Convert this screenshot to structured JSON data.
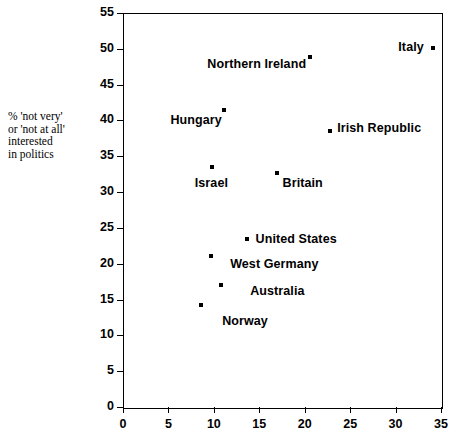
{
  "axis_caption": "% 'not very'\nor 'not at all'\ninterested\nin politics",
  "chart_data": {
    "type": "scatter",
    "title": "",
    "xlabel": "",
    "ylabel": "% 'not very' or 'not at all' interested in politics",
    "xlim": [
      0,
      35
    ],
    "ylim": [
      0,
      55
    ],
    "xticks": [
      "0",
      "5",
      "10",
      "15",
      "20",
      "25",
      "30",
      "35"
    ],
    "yticks": [
      "0",
      "5",
      "10",
      "15",
      "20",
      "25",
      "30",
      "35",
      "40",
      "45",
      "50",
      "55"
    ],
    "grid": false,
    "legend": "none",
    "marker_color": "#000000",
    "points": [
      {
        "label": "Italy",
        "x": 34.1,
        "y": 50.1,
        "label_side": "left",
        "label_dx": -9,
        "label_dy": -1
      },
      {
        "label": "Northern Ireland",
        "x": 20.6,
        "y": 48.9,
        "label_side": "left",
        "label_dx": -4,
        "label_dy": 7
      },
      {
        "label": "Hungary",
        "x": 11.1,
        "y": 41.5,
        "label_side": "left",
        "label_dx": -2,
        "label_dy": 10
      },
      {
        "label": "Irish Republic",
        "x": 22.8,
        "y": 38.5,
        "label_side": "right",
        "label_dx": 7,
        "label_dy": -3
      },
      {
        "label": "Israel",
        "x": 9.8,
        "y": 33.5,
        "label_side": "left",
        "label_dx": 16,
        "label_dy": 16
      },
      {
        "label": "Britain",
        "x": 16.9,
        "y": 32.7,
        "label_side": "right",
        "label_dx": 6,
        "label_dy": 10
      },
      {
        "label": "United States",
        "x": 13.6,
        "y": 23.5,
        "label_side": "right",
        "label_dx": 9,
        "label_dy": 0
      },
      {
        "label": "West Germany",
        "x": 9.7,
        "y": 21.1,
        "label_side": "right",
        "label_dx": 19,
        "label_dy": 8
      },
      {
        "label": "Australia",
        "x": 10.8,
        "y": 17.0,
        "label_side": "right",
        "label_dx": 29,
        "label_dy": 6
      },
      {
        "label": "Norway",
        "x": 8.6,
        "y": 14.2,
        "label_side": "right",
        "label_dx": 21,
        "label_dy": 16
      }
    ]
  }
}
